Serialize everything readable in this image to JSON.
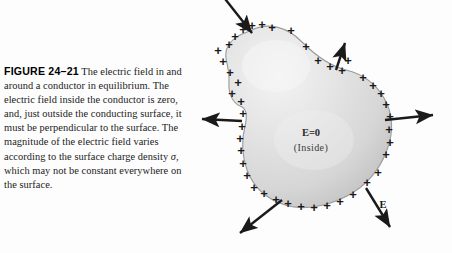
{
  "figure": {
    "label": "FIGURE 24–21",
    "caption_text": " The electric field in and around a conductor in equilibrium. The electric field inside the conductor is zero, and, just outside the conducting surface, it must be perpendicular to the surface. The magnitude of the electric field varies according to the surface charge density ",
    "caption_tail": ", which may not be constant everywhere on the surface.",
    "sigma_symbol": "σ"
  },
  "diagram": {
    "inside_label": "E=0",
    "inside_sublabel": "(Inside)",
    "field_label": "E",
    "charge_symbol": "+",
    "colors": {
      "conductor_fill": "#dcdcdc",
      "conductor_highlight": "#f2f2f2",
      "conductor_edge": "#8c8c8c",
      "arrow": "#1a1a1a",
      "charge": "#1a1a1a",
      "background": "#fdfdfd"
    },
    "charges": [
      {
        "x": 48,
        "y": 84
      },
      {
        "x": 42,
        "y": 95
      },
      {
        "x": 40,
        "y": 74
      },
      {
        "x": 33,
        "y": 63
      },
      {
        "x": 28,
        "y": 52
      },
      {
        "x": 39,
        "y": 46
      },
      {
        "x": 45,
        "y": 38
      },
      {
        "x": 53,
        "y": 31
      },
      {
        "x": 62,
        "y": 27
      },
      {
        "x": 72,
        "y": 26
      },
      {
        "x": 82,
        "y": 29
      },
      {
        "x": 101,
        "y": 32
      },
      {
        "x": 116,
        "y": 48
      },
      {
        "x": 128,
        "y": 62
      },
      {
        "x": 140,
        "y": 68
      },
      {
        "x": 152,
        "y": 72
      },
      {
        "x": 158,
        "y": 62
      },
      {
        "x": 173,
        "y": 79
      },
      {
        "x": 183,
        "y": 87
      },
      {
        "x": 191,
        "y": 95
      },
      {
        "x": 196,
        "y": 106
      },
      {
        "x": 200,
        "y": 118
      },
      {
        "x": 199,
        "y": 131
      },
      {
        "x": 200,
        "y": 144
      },
      {
        "x": 196,
        "y": 156
      },
      {
        "x": 188,
        "y": 174
      },
      {
        "x": 177,
        "y": 184
      },
      {
        "x": 163,
        "y": 196
      },
      {
        "x": 150,
        "y": 203
      },
      {
        "x": 137,
        "y": 207
      },
      {
        "x": 124,
        "y": 209
      },
      {
        "x": 111,
        "y": 208
      },
      {
        "x": 98,
        "y": 205
      },
      {
        "x": 86,
        "y": 201
      },
      {
        "x": 74,
        "y": 195
      },
      {
        "x": 64,
        "y": 189
      },
      {
        "x": 57,
        "y": 177
      },
      {
        "x": 53,
        "y": 165
      },
      {
        "x": 51,
        "y": 152
      },
      {
        "x": 50,
        "y": 140
      },
      {
        "x": 52,
        "y": 128
      },
      {
        "x": 53,
        "y": 115
      },
      {
        "x": 51,
        "y": 103
      }
    ],
    "arrows": [
      {
        "name": "arrow-top-left-inward",
        "x1": 28,
        "y1": -10,
        "x2": 62,
        "y2": 33
      },
      {
        "name": "arrow-top-outward",
        "x1": 146,
        "y1": 70,
        "x2": 155,
        "y2": 43
      },
      {
        "name": "arrow-right-outward",
        "x1": 195,
        "y1": 120,
        "x2": 243,
        "y2": 115
      },
      {
        "name": "arrow-left-outward",
        "x1": 52,
        "y1": 121,
        "x2": 12,
        "y2": 119
      },
      {
        "name": "arrow-bottom-left-outward",
        "x1": 92,
        "y1": 200,
        "x2": 50,
        "y2": 233
      },
      {
        "name": "arrow-bottom-right-outward",
        "x1": 176,
        "y1": 188,
        "x2": 200,
        "y2": 227
      }
    ],
    "field_label_pos": {
      "x": 193,
      "y": 208
    }
  }
}
